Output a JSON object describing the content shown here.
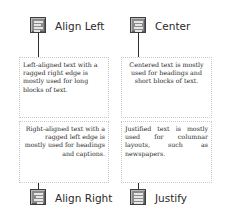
{
  "panels": [
    {
      "id": "align-left",
      "label": "Align Left",
      "icon": "align-left-icon",
      "alignment": "left",
      "description": "Left-aligned text with a ragged right edge is mostly used for long blocks of text."
    },
    {
      "id": "center",
      "label": "Center",
      "icon": "align-center-icon",
      "alignment": "center",
      "description": "Centered text is mostly used for headings and short blocks of text."
    },
    {
      "id": "align-right",
      "label": "Align Right",
      "icon": "align-right-icon",
      "alignment": "right",
      "description": "Right-aligned text with a ragged left edge is mostly used for headings and captions."
    },
    {
      "id": "justify",
      "label": "Justify",
      "icon": "justify-icon",
      "alignment": "justify",
      "description": "Justified text is mostly used for columnar layouts, such as newspapers."
    }
  ],
  "colors": {
    "icon_fill": "#8a8a8a",
    "icon_border": "#3e3e3e",
    "icon_bars": "#e6e6e6",
    "connector": "#2e2e2e",
    "box_border": "#c8c8c8",
    "text": "#2a2a2a"
  }
}
